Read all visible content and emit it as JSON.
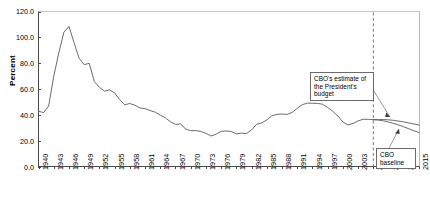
{
  "chart_data": {
    "type": "line",
    "title": "",
    "xlabel": "",
    "ylabel": "Percent",
    "ylim": [
      0,
      120
    ],
    "xlim": [
      1940,
      2015
    ],
    "yticks": [
      "0.0",
      "20.0",
      "40.0",
      "60.0",
      "80.0",
      "100.0",
      "120.0"
    ],
    "ytick_values": [
      0,
      20,
      40,
      60,
      80,
      100,
      120
    ],
    "xticks": [
      "1940",
      "1943",
      "1946",
      "1949",
      "1952",
      "1955",
      "1958",
      "1961",
      "1964",
      "1967",
      "1970",
      "1973",
      "1976",
      "1979",
      "1982",
      "1985",
      "1988",
      "1991",
      "1994",
      "1997",
      "2000",
      "2003",
      "2006",
      "2009",
      "2012",
      "2015"
    ],
    "grid": false,
    "legend": "none",
    "series": [
      {
        "name": "Historical debt held by the public",
        "x": [
          1940,
          1941,
          1942,
          1943,
          1944,
          1945,
          1946,
          1947,
          1948,
          1949,
          1950,
          1951,
          1952,
          1953,
          1954,
          1955,
          1956,
          1957,
          1958,
          1959,
          1960,
          1961,
          1962,
          1963,
          1964,
          1965,
          1966,
          1967,
          1968,
          1969,
          1970,
          1971,
          1972,
          1973,
          1974,
          1975,
          1976,
          1977,
          1978,
          1979,
          1980,
          1981,
          1982,
          1983,
          1984,
          1985,
          1986,
          1987,
          1988,
          1989,
          1990,
          1991,
          1992,
          1993,
          1994,
          1995,
          1996,
          1997,
          1998,
          1999,
          2000,
          2001,
          2002,
          2003,
          2004,
          2005,
          2006
        ],
        "values": [
          43.0,
          42.0,
          47.0,
          70.0,
          88.0,
          104.0,
          108.5,
          96.0,
          84.0,
          79.0,
          80.0,
          66.0,
          61.5,
          58.6,
          59.5,
          57.2,
          52.0,
          48.0,
          49.0,
          47.7,
          45.6,
          45.0,
          43.6,
          42.3,
          40.0,
          38.0,
          34.9,
          32.9,
          33.3,
          29.3,
          28.0,
          28.1,
          27.4,
          26.0,
          23.9,
          25.3,
          27.5,
          27.8,
          27.4,
          25.6,
          26.1,
          25.8,
          28.7,
          33.0,
          34.0,
          36.3,
          39.5,
          40.6,
          40.9,
          40.6,
          42.1,
          45.3,
          48.1,
          49.3,
          49.2,
          49.1,
          48.4,
          45.9,
          43.0,
          39.4,
          34.7,
          32.5,
          33.6,
          35.6,
          36.8,
          36.8,
          36.5
        ]
      },
      {
        "name": "CBO baseline",
        "x": [
          2006,
          2007,
          2008,
          2009,
          2010,
          2011,
          2012,
          2013,
          2014,
          2015
        ],
        "values": [
          36.5,
          36.2,
          35.6,
          34.7,
          33.6,
          32.4,
          31.0,
          29.5,
          28.0,
          26.6
        ]
      },
      {
        "name": "CBO's estimate of the President's budget",
        "x": [
          2006,
          2007,
          2008,
          2009,
          2010,
          2011,
          2012,
          2013,
          2014,
          2015
        ],
        "values": [
          36.5,
          36.6,
          36.6,
          36.4,
          36.0,
          35.4,
          34.8,
          34.0,
          33.2,
          32.4
        ]
      }
    ],
    "annotations": [
      {
        "name": "president-budget-callout",
        "text": "CBO's estimate of the President's budget",
        "points_to_year": 2011
      },
      {
        "name": "cbo-baseline-callout",
        "text": "CBO baseline",
        "points_to_year": 2012
      },
      {
        "name": "projection-divider",
        "text": "",
        "year": 2006,
        "style": "dashed-vertical"
      }
    ]
  },
  "colors": {
    "line": "#5a5a5a",
    "axis": "#4a4a4a",
    "callout_border": "#6b6b6b",
    "divider": "#6b6b6b"
  }
}
